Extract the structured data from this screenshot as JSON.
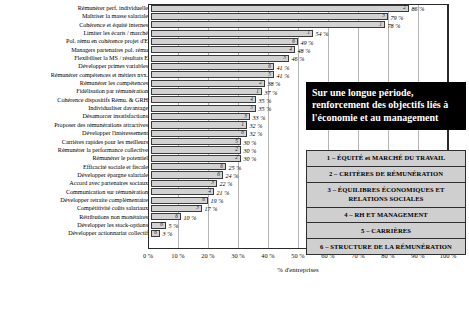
{
  "chart_data": {
    "type": "bar",
    "orientation": "horizontal",
    "title": "",
    "xlabel": "% d'entreprises",
    "ylabel": "",
    "xlim": [
      0,
      100
    ],
    "grid": true,
    "legend_position": "right",
    "xticks": [
      "0 %",
      "10 %",
      "20 %",
      "30 %",
      "40 %",
      "50 %",
      "60 %",
      "70 %",
      "80 %",
      "90 %",
      "100 %"
    ],
    "xtick_values": [
      0,
      10,
      20,
      30,
      40,
      50,
      60,
      70,
      80,
      90,
      100
    ],
    "categories": [
      "Rémunérer perf. individuelle",
      "Maîtriser la masse salariale",
      "Cohérence et équité internes",
      "Limiter les écarts / marché",
      "Pol. rému en cohérence projet d'E",
      "Managers partenaires pol. rému",
      "Flexibiliser la MS / résultats E",
      "Développer primes variables",
      "Rémunérer compétences et métiers nvx.",
      "Rémunérer les compétences",
      "Fidélisation par rémunération",
      "Cohérence dispositifs Rému. & GRH",
      "Individualiser davantage",
      "Désamorcer insatisfactions",
      "Proposer des rémunérations attractives",
      "Développer l'intéressement",
      "Carrières rapides pour les meilleurs",
      "Rémunérer la performance collective",
      "Rémunérer le potentiel",
      "Efficacité sociale et fiscale",
      "Développer épargne salariale",
      "Accord avec partenaires sociaux",
      "Communication sur rémunération",
      "Développer retraite complémentaire",
      "Compétitivité coûts salariaux",
      "Rétributions non monétaires",
      "Développer les stock-options",
      "Développer actionnariat collectif"
    ],
    "values": [
      86,
      79,
      78,
      54,
      49,
      48,
      46,
      41,
      41,
      38,
      37,
      35,
      35,
      33,
      32,
      32,
      30,
      30,
      30,
      25,
      24,
      22,
      21,
      19,
      17,
      10,
      5,
      3
    ],
    "value_labels": [
      "86 %",
      "79 %",
      "78 %",
      "54 %",
      "49 %",
      "48 %",
      "46 %",
      "41 %",
      "41 %",
      "38 %",
      "37 %",
      "35 %",
      "35 %",
      "33 %",
      "32 %",
      "32 %",
      "30 %",
      "30 %",
      "30 %",
      "25 %",
      "24 %",
      "22 %",
      "21 %",
      "19 %",
      "17 %",
      "10 %",
      "5 %",
      "3 %"
    ],
    "group_codes": [
      2,
      3,
      1,
      1,
      6,
      4,
      3,
      6,
      5,
      2,
      1,
      4,
      5,
      3,
      1,
      6,
      5,
      2,
      2,
      6,
      6,
      3,
      4,
      6,
      3,
      6,
      6,
      6
    ]
  },
  "callout": {
    "text": "Sur une longue période, renforcement des objectifs liés à l'économie et au management"
  },
  "legend": {
    "items": [
      "1 – ÉQUITÉ et MARCHÉ DU TRAVAIL",
      "2 – CRITÈRES DE RÉMUNÉRATION",
      "3 – ÉQUILIBRES ÉCONOMIQUES ET RELATIONS SOCIALES",
      "4 – RH ET MANAGEMENT",
      "5 – CARRIÈRES",
      "6 – STRUCTURE DE LA RÉMUNÉRATION"
    ]
  }
}
